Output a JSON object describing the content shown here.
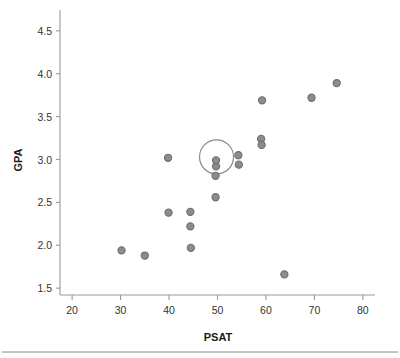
{
  "chart_data": {
    "type": "scatter",
    "title": "",
    "xlabel": "PSAT",
    "ylabel": "GPA",
    "xlim": [
      17.5,
      82.5
    ],
    "ylim": [
      1.42,
      4.72
    ],
    "xticks": [
      20,
      30,
      40,
      50,
      60,
      70,
      80
    ],
    "xtick_labels": [
      "20",
      "30",
      "40",
      "50",
      "60",
      "70",
      "80"
    ],
    "yticks": [
      1.5,
      2.0,
      2.5,
      3.0,
      3.5,
      4.0,
      4.5
    ],
    "ytick_labels": [
      "1.5",
      "2.0",
      "2.5",
      "3.0",
      "3.5",
      "4.0",
      "4.5"
    ],
    "grid": false,
    "legend": null,
    "marker_color": "#8c8c8c",
    "marker_edge_color": "#6e6e6e",
    "points": [
      {
        "x": 30.2,
        "y": 1.94
      },
      {
        "x": 35.0,
        "y": 1.88
      },
      {
        "x": 39.8,
        "y": 3.02
      },
      {
        "x": 39.9,
        "y": 2.38
      },
      {
        "x": 44.4,
        "y": 2.39
      },
      {
        "x": 44.4,
        "y": 2.22
      },
      {
        "x": 44.5,
        "y": 1.97
      },
      {
        "x": 49.6,
        "y": 2.56
      },
      {
        "x": 49.6,
        "y": 2.81
      },
      {
        "x": 49.7,
        "y": 2.92
      },
      {
        "x": 49.7,
        "y": 2.99
      },
      {
        "x": 54.3,
        "y": 3.05
      },
      {
        "x": 54.4,
        "y": 2.94
      },
      {
        "x": 59.0,
        "y": 3.24
      },
      {
        "x": 59.1,
        "y": 3.17
      },
      {
        "x": 59.2,
        "y": 3.69
      },
      {
        "x": 63.8,
        "y": 1.66
      },
      {
        "x": 69.4,
        "y": 3.72
      },
      {
        "x": 74.6,
        "y": 3.89
      }
    ],
    "highlight": {
      "x": 49.8,
      "y": 3.03,
      "radius_px": 17,
      "color": "#8a8a8a"
    }
  },
  "footer": {
    "rule_color": "#888888"
  }
}
